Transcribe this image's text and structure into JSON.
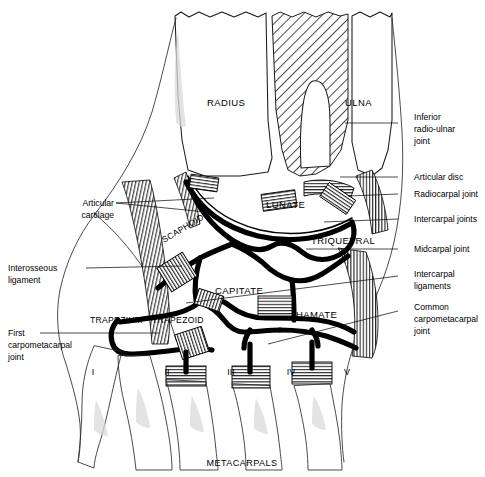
{
  "figure": {
    "caption": "METACARPALS",
    "colors": {
      "ink": "#000000",
      "outline": "#1a1a1a",
      "background": "#ffffff",
      "shading": "#d9d9d9"
    }
  },
  "bones": {
    "radius": "RADIUS",
    "ulna": "ULNA",
    "scaphoid": "SCAPHOID",
    "lunate": "LUNATE",
    "triquetral": "TRIQUETRAL",
    "capitate": "CAPITATE",
    "hamate": "HAMATE",
    "trapezium": "TRAPEZIUM",
    "trapezoid": "TRAPEZOID"
  },
  "metacarpals": [
    {
      "numeral": "I"
    },
    {
      "numeral": "II"
    },
    {
      "numeral": "III"
    },
    {
      "numeral": "IV"
    },
    {
      "numeral": "V"
    }
  ],
  "labels_left": [
    {
      "id": "articular-cartilage",
      "lines": [
        "Articular",
        "cartilage"
      ]
    },
    {
      "id": "interosseous-ligament",
      "lines": [
        "Interosseous",
        "ligament"
      ]
    },
    {
      "id": "first-carpometacarpal-joint",
      "lines": [
        "First",
        "carpometacarpal",
        "joint"
      ]
    }
  ],
  "labels_right": [
    {
      "id": "inferior-radio-ulnar-joint",
      "lines": [
        "Inferior",
        "radio-ulnar",
        "joint"
      ]
    },
    {
      "id": "articular-disc",
      "lines": [
        "Articular disc"
      ]
    },
    {
      "id": "radiocarpal-joint",
      "lines": [
        "Radiocarpal joint"
      ]
    },
    {
      "id": "intercarpal-joints",
      "lines": [
        "Intercarpal joints"
      ]
    },
    {
      "id": "midcarpal-joint",
      "lines": [
        "Midcarpal joint"
      ]
    },
    {
      "id": "intercarpal-ligaments",
      "lines": [
        "Intercarpal",
        "ligaments"
      ]
    },
    {
      "id": "common-carpometacarpal-joint",
      "lines": [
        "Common",
        "carpometacarpal",
        "joint"
      ]
    }
  ]
}
